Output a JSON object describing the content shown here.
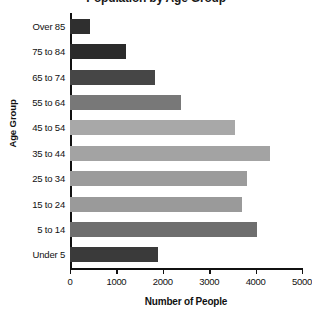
{
  "chart_data": {
    "type": "bar",
    "orientation": "horizontal",
    "title": "Population by Age Group",
    "xlabel": "Number of People",
    "ylabel": "Age Group",
    "categories": [
      "Over 85",
      "75 to 84",
      "65 to 74",
      "55 to 64",
      "45 to 54",
      "35 to 44",
      "25 to 34",
      "15 to 24",
      "5 to 14",
      "Under 5"
    ],
    "values": [
      430,
      1200,
      1830,
      2390,
      3550,
      4300,
      3820,
      3700,
      4030,
      1900
    ],
    "bar_colors": [
      "#2f2f2f",
      "#2b2b2b",
      "#464646",
      "#787878",
      "#a8a8a8",
      "#a3a3a3",
      "#9b9b9b",
      "#9a9a9a",
      "#6e6e6e",
      "#3a3a3a"
    ],
    "xlim": [
      0,
      5000
    ],
    "xticks": [
      0,
      1000,
      2000,
      3000,
      4000,
      5000
    ],
    "xtick_labels": [
      "0",
      "1000",
      "2000",
      "3000",
      "4000",
      "5000"
    ],
    "grid": false,
    "legend": false,
    "axis_color": "#111111",
    "background": "#ffffff"
  }
}
